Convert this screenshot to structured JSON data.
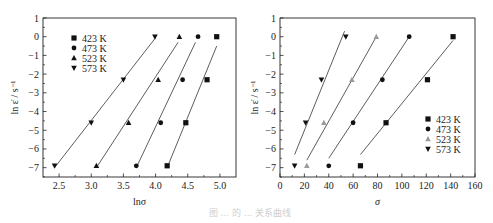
{
  "chart_data": [
    {
      "type": "scatter",
      "title": "",
      "xlabel": "lnσ",
      "ylabel": "ln ε̇ / s⁻¹",
      "xlim": [
        2.25,
        5.25
      ],
      "ylim": [
        -7.5,
        1
      ],
      "xticks": [
        2.5,
        3.0,
        3.5,
        4.0,
        4.5,
        5.0
      ],
      "xtick_labels": [
        "2.5",
        "3.0",
        "3.5",
        "4.0",
        "4.5",
        "5.0"
      ],
      "yticks": [
        1,
        0,
        -1,
        -2,
        -3,
        -4,
        -5,
        -6,
        -7
      ],
      "ytick_labels": [
        "1",
        "0",
        "−1",
        "−2",
        "−3",
        "−4",
        "−5",
        "−6",
        "−7"
      ],
      "legend_position": "upper left",
      "grid": false,
      "fit_lines": true,
      "series": [
        {
          "name": "423 K",
          "marker": "square",
          "x": [
            4.95,
            4.8,
            4.47,
            4.18
          ],
          "y": [
            0,
            -2.3,
            -4.6,
            -6.9
          ],
          "fit": [
            [
              4.18,
              -7.0
            ],
            [
              4.95,
              -0.5
            ]
          ]
        },
        {
          "name": "473 K",
          "marker": "circle",
          "x": [
            4.66,
            4.42,
            4.08,
            3.7
          ],
          "y": [
            0,
            -2.3,
            -4.6,
            -6.9
          ],
          "fit": [
            [
              3.7,
              -7.0
            ],
            [
              4.62,
              -0.3
            ]
          ]
        },
        {
          "name": "523 K",
          "marker": "triangle-up",
          "x": [
            4.37,
            4.04,
            3.58,
            3.08
          ],
          "y": [
            0,
            -2.3,
            -4.6,
            -6.9
          ],
          "fit": [
            [
              3.08,
              -7.0
            ],
            [
              4.35,
              -0.3
            ]
          ]
        },
        {
          "name": "573 K",
          "marker": "triangle-down",
          "x": [
            3.99,
            3.5,
            3.0,
            2.43
          ],
          "y": [
            0,
            -2.3,
            -4.6,
            -6.9
          ],
          "fit": [
            [
              2.43,
              -7.0
            ],
            [
              3.99,
              -0.1
            ]
          ]
        }
      ]
    },
    {
      "type": "scatter",
      "title": "",
      "xlabel": "σ",
      "ylabel": "ln ε̇ / s⁻¹",
      "xlim": [
        0,
        160
      ],
      "ylim": [
        -7.5,
        1
      ],
      "xticks": [
        0,
        20,
        40,
        60,
        80,
        100,
        120,
        140,
        160
      ],
      "xtick_labels": [
        "0",
        "20",
        "40",
        "60",
        "80",
        "100",
        "120",
        "140",
        "160"
      ],
      "yticks": [
        1,
        0,
        -1,
        -2,
        -3,
        -4,
        -5,
        -6,
        -7
      ],
      "ytick_labels": [
        "1",
        "0",
        "−1",
        "−2",
        "−3",
        "−4",
        "−5",
        "−6",
        "−7"
      ],
      "legend_position": "lower right",
      "grid": false,
      "fit_lines": true,
      "series": [
        {
          "name": "423 K",
          "marker": "square",
          "x": [
            142,
            121,
            87,
            66
          ],
          "y": [
            0,
            -2.3,
            -4.6,
            -6.9
          ],
          "fit": [
            [
              66,
              -6.3
            ],
            [
              142,
              -0.2
            ]
          ]
        },
        {
          "name": "473 K",
          "marker": "circle",
          "x": [
            106,
            84,
            60,
            40
          ],
          "y": [
            0,
            -2.3,
            -4.6,
            -6.9
          ],
          "fit": [
            [
              40,
              -6.5
            ],
            [
              106,
              0
            ]
          ]
        },
        {
          "name": "523 K",
          "marker": "triangle-up",
          "x": [
            79,
            59,
            36,
            22
          ],
          "y": [
            0,
            -2.3,
            -4.6,
            -6.9
          ],
          "fit": [
            [
              22,
              -6.6
            ],
            [
              79,
              0
            ]
          ]
        },
        {
          "name": "573 K",
          "marker": "triangle-down",
          "x": [
            54,
            34,
            21,
            12
          ],
          "y": [
            0,
            -2.3,
            -4.6,
            -6.9
          ],
          "fit": [
            [
              12,
              -6.3
            ],
            [
              53,
              0.3
            ]
          ]
        }
      ]
    }
  ],
  "caption": "图 ... 的 ... 关系曲线",
  "colors": {
    "axis": "#222222",
    "marker": "#111111",
    "marker_523": "#9a9a9a",
    "fit": "#333333"
  }
}
